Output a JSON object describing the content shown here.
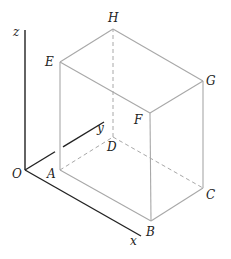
{
  "diagram": {
    "type": "3d-rectangular-box-with-axes",
    "colors": {
      "axis": "#222222",
      "edge": "#a8a8a8",
      "hidden_edge": "#a8a8a8",
      "label": "#222222"
    },
    "axes": {
      "origin": {
        "label": "O",
        "point": [
          25,
          170
        ],
        "label_pos": [
          12,
          178
        ]
      },
      "z": {
        "label": "z",
        "end": [
          25,
          30
        ],
        "label_pos": [
          13,
          36
        ]
      },
      "y": {
        "label": "y",
        "end": [
          104,
          122
        ],
        "label_pos": [
          97,
          132
        ]
      },
      "x": {
        "label": "x",
        "end": [
          141,
          236
        ],
        "label_pos": [
          130,
          245
        ]
      }
    },
    "vertices": {
      "A": {
        "label": "A",
        "point": [
          60,
          170
        ],
        "label_pos": [
          47,
          178
        ]
      },
      "B": {
        "label": "B",
        "point": [
          151,
          221
        ],
        "label_pos": [
          146,
          236
        ]
      },
      "C": {
        "label": "C",
        "point": [
          203,
          188
        ],
        "label_pos": [
          206,
          199
        ]
      },
      "D": {
        "label": "D",
        "point": [
          113,
          137
        ],
        "label_pos": [
          107,
          151
        ]
      },
      "E": {
        "label": "E",
        "point": [
          60,
          62
        ],
        "label_pos": [
          45,
          66
        ]
      },
      "F": {
        "label": "F",
        "point": [
          150,
          113
        ],
        "label_pos": [
          134,
          124
        ]
      },
      "G": {
        "label": "G",
        "point": [
          203,
          81
        ],
        "label_pos": [
          206,
          85
        ]
      },
      "H": {
        "label": "H",
        "point": [
          113,
          29
        ],
        "label_pos": [
          108,
          22
        ]
      }
    },
    "visible_edges": [
      [
        "A",
        "B"
      ],
      [
        "B",
        "C"
      ],
      [
        "C",
        "G"
      ],
      [
        "G",
        "F"
      ],
      [
        "F",
        "B"
      ],
      [
        "F",
        "E"
      ],
      [
        "E",
        "A"
      ],
      [
        "E",
        "H"
      ],
      [
        "H",
        "G"
      ]
    ],
    "hidden_edges": [
      [
        "A",
        "D"
      ],
      [
        "D",
        "C"
      ],
      [
        "D",
        "H"
      ]
    ]
  }
}
